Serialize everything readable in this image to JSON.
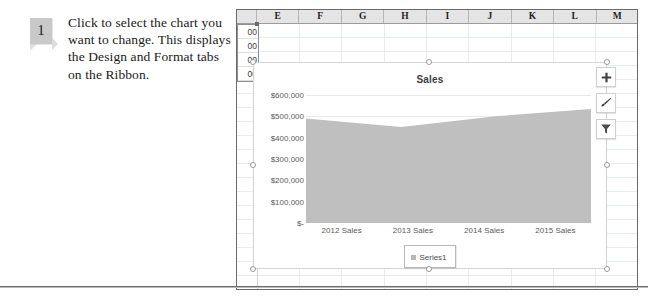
{
  "instruction": {
    "step_number": "1",
    "text": "Click to select the chart you want to change. This displays the Design and Format tabs on the Ribbon."
  },
  "spreadsheet": {
    "column_headers": [
      "E",
      "F",
      "G",
      "H",
      "I",
      "J",
      "K",
      "L",
      "M"
    ],
    "selected_cells": [
      "00",
      "00",
      "00",
      "00"
    ]
  },
  "chart_buttons": [
    {
      "name": "chart-elements-button",
      "icon": "plus-icon",
      "glyph": "+"
    },
    {
      "name": "chart-styles-button",
      "icon": "paintbrush-icon",
      "glyph": ""
    },
    {
      "name": "chart-filters-button",
      "icon": "funnel-icon",
      "glyph": ""
    }
  ],
  "chart_data": {
    "type": "area",
    "title": "Sales",
    "categories": [
      "2012 Sales",
      "2013 Sales",
      "2014 Sales",
      "2015 Sales"
    ],
    "series": [
      {
        "name": "Series1",
        "values": [
          490000,
          450000,
          500000,
          535000
        ]
      }
    ],
    "ytick_labels": [
      "$600,000",
      "$500,000",
      "$400,000",
      "$300,000",
      "$200,000",
      "$100,000",
      "$-"
    ],
    "ytick_values": [
      600000,
      500000,
      400000,
      300000,
      200000,
      100000,
      0
    ],
    "ylim": [
      0,
      600000
    ],
    "xlabel": "",
    "ylabel": "",
    "grid": true,
    "legend_position": "bottom",
    "series_color": "#bfbfbf"
  }
}
